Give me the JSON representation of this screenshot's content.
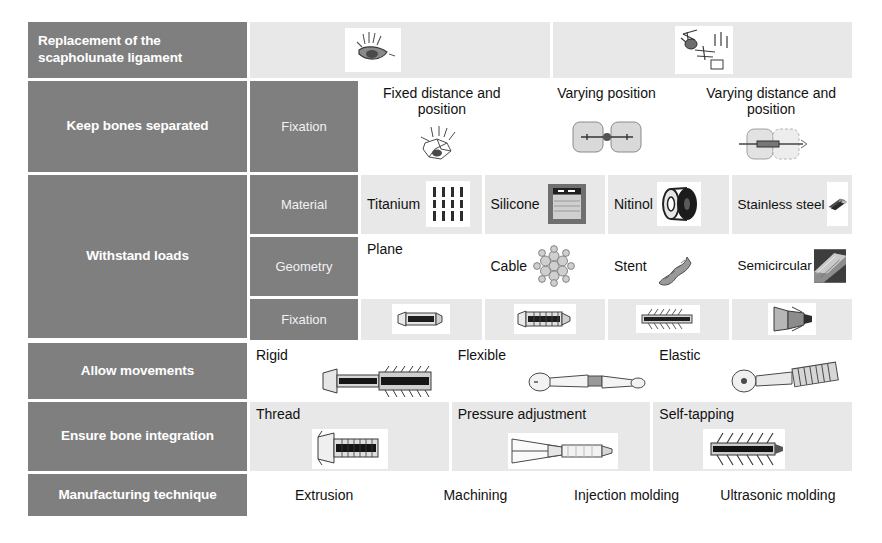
{
  "colors": {
    "label_bg": "#7f7f7f",
    "label_text": "#ffffff",
    "sub_label_text": "#f2f2f2",
    "cell_bg": "#ffffff",
    "cell_bg_shaded": "#e8e8e8",
    "page_bg": "#ffffff"
  },
  "rows": [
    {
      "function": "Replacement of the scapholunate ligament",
      "sub_function": null,
      "options": [
        {
          "label": "",
          "image": "wrist-bones-ligament-diagram"
        },
        {
          "label": "",
          "image": "wrist-anatomy-sketch"
        }
      ]
    },
    {
      "function": "Keep bones separated",
      "sub_function": "Fixation",
      "options": [
        {
          "label": "Fixed distance and position",
          "image": "carpal-bones-drawing"
        },
        {
          "label": "Varying position",
          "image": "two-bones-with-link"
        },
        {
          "label": "Varying distance and position",
          "image": "two-bones-sliding-link"
        }
      ]
    },
    {
      "function": "Withstand loads",
      "sub_function": "Material",
      "options": [
        {
          "label": "Titanium",
          "image": "titanium-pins-photo"
        },
        {
          "label": "Silicone",
          "image": "silicone-jar-photo"
        },
        {
          "label": "Nitinol",
          "image": "nitinol-wire-spool-photo"
        },
        {
          "label": "Stainless steel",
          "image": "stainless-steel-tubes-photo"
        }
      ]
    },
    {
      "function": null,
      "sub_function": "Geometry",
      "options": [
        {
          "label": "Plane",
          "image": null
        },
        {
          "label": "Cable",
          "image": "braided-cable-cross-section"
        },
        {
          "label": "Stent",
          "image": "stent-photo"
        },
        {
          "label": "Semicircular",
          "image": "semicircular-profile-photo"
        }
      ]
    },
    {
      "function": null,
      "sub_function": "Fixation",
      "options": [
        {
          "label": "",
          "image": "smooth-anchor-screw"
        },
        {
          "label": "",
          "image": "ribbed-anchor-screw"
        },
        {
          "label": "",
          "image": "barbed-anchor-screw"
        },
        {
          "label": "",
          "image": "expanding-anchor-head"
        }
      ]
    },
    {
      "function": "Allow movements",
      "sub_function": null,
      "options": [
        {
          "label": "Rigid",
          "image": "rigid-screw-implant"
        },
        {
          "label": "Flexible",
          "image": "flexible-dumbbell-implant"
        },
        {
          "label": "Elastic",
          "image": "elastic-spring-implant"
        }
      ]
    },
    {
      "function": "Ensure bone integration",
      "sub_function": null,
      "options": [
        {
          "label": "Thread",
          "image": "threaded-screw-head"
        },
        {
          "label": "Pressure adjustment",
          "image": "pressure-adjust-cone"
        },
        {
          "label": "Self-tapping",
          "image": "self-tapping-screw"
        }
      ]
    },
    {
      "function": "Manufacturing technique",
      "sub_function": null,
      "options": [
        {
          "label": "Extrusion",
          "image": null
        },
        {
          "label": "Machining",
          "image": null
        },
        {
          "label": "Injection molding",
          "image": null
        },
        {
          "label": "Ultrasonic molding",
          "image": null
        }
      ]
    }
  ]
}
